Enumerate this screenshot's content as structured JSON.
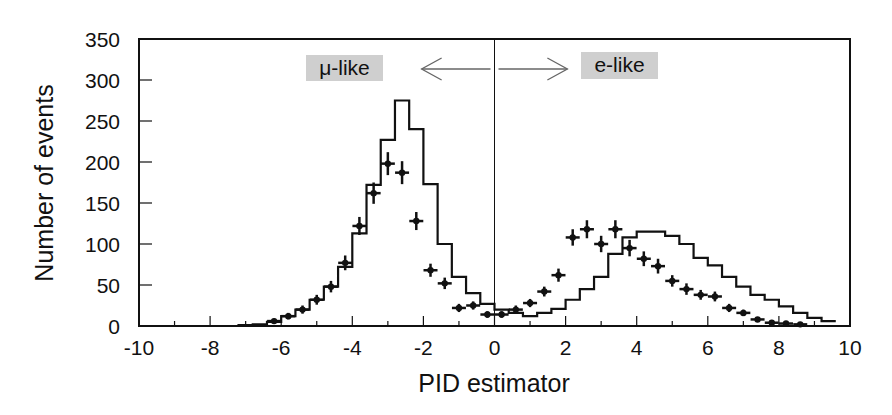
{
  "chart_data": {
    "type": "bar",
    "subtype": "histogram-with-data-points",
    "title": "",
    "xlabel": "PID estimator",
    "ylabel": "Number of events",
    "xlim": [
      -10,
      10
    ],
    "ylim": [
      0,
      350
    ],
    "x_ticks": [
      -10,
      -8,
      -6,
      -4,
      -2,
      0,
      2,
      4,
      6,
      8,
      10
    ],
    "y_ticks": [
      0,
      50,
      100,
      150,
      200,
      250,
      300,
      350
    ],
    "grid": false,
    "cut_line_x": 0,
    "annotations": [
      {
        "text": "μ-like",
        "x": -6.0,
        "y": 305,
        "boxed": true,
        "box_color": "#cfcfcf"
      },
      {
        "text": "e-like",
        "x": 3.7,
        "y": 307,
        "boxed": true,
        "box_color": "#cfcfcf"
      },
      {
        "text": "left-arrow",
        "from_x": -0.1,
        "to_x": -2.0,
        "y": 301
      },
      {
        "text": "right-arrow",
        "from_x": 0.1,
        "to_x": 2.0,
        "y": 301
      }
    ],
    "bin_width": 0.4,
    "series": [
      {
        "name": "MC histogram",
        "style": "step",
        "bin_edges_start": -7.2,
        "values": [
          1,
          2,
          5,
          12,
          20,
          32,
          48,
          72,
          113,
          172,
          227,
          275,
          240,
          173,
          100,
          60,
          40,
          27,
          20,
          16,
          12,
          16,
          21,
          32,
          45,
          60,
          88,
          108,
          115,
          115,
          110,
          100,
          83,
          74,
          60,
          48,
          38,
          32,
          24,
          16,
          10,
          6,
          4,
          3,
          2,
          2,
          2,
          1,
          1,
          1,
          1,
          1,
          1,
          1,
          1,
          1,
          1,
          1,
          1,
          1,
          1,
          1,
          1,
          1,
          1,
          1,
          1,
          1,
          1,
          1,
          1,
          1,
          1,
          1,
          1,
          1,
          1,
          1,
          1,
          1,
          1,
          1,
          1,
          1,
          1,
          1,
          1,
          1,
          1
        ]
      },
      {
        "name": "Data",
        "style": "points-with-errorbars",
        "x": [
          -6.2,
          -5.8,
          -5.4,
          -5.0,
          -4.6,
          -4.2,
          -3.8,
          -3.4,
          -3.0,
          -2.6,
          -2.2,
          -1.8,
          -1.4,
          -1.0,
          -0.6,
          -0.2,
          0.2,
          0.6,
          1.0,
          1.4,
          1.8,
          2.2,
          2.6,
          3.0,
          3.4,
          3.8,
          4.2,
          4.6,
          5.0,
          5.4,
          5.8,
          6.2,
          6.6,
          7.0,
          7.4,
          7.8,
          8.2,
          8.6
        ],
        "y": [
          6,
          12,
          20,
          32,
          48,
          77,
          122,
          162,
          198,
          187,
          128,
          68,
          52,
          22,
          25,
          14,
          14,
          20,
          28,
          42,
          62,
          108,
          118,
          100,
          118,
          95,
          82,
          73,
          55,
          45,
          38,
          36,
          22,
          16,
          8,
          4,
          3,
          2
        ],
        "yerr": [
          3,
          4,
          5,
          6,
          7,
          9,
          11,
          13,
          14,
          14,
          11,
          8,
          7,
          5,
          5,
          4,
          4,
          5,
          5,
          6,
          8,
          10,
          11,
          10,
          11,
          10,
          9,
          9,
          7,
          7,
          6,
          6,
          5,
          4,
          3,
          2,
          2,
          1
        ]
      }
    ]
  },
  "labels": {
    "ylabel": "Number of events",
    "xlabel": "PID estimator",
    "mu_like": "μ-like",
    "e_like": "e-like"
  }
}
